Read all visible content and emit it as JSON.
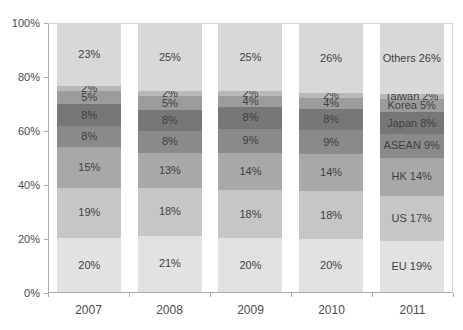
{
  "chart_data": {
    "type": "bar",
    "subtype": "stacked-100",
    "title": "",
    "xlabel": "",
    "ylabel": "",
    "categories": [
      "2007",
      "2008",
      "2009",
      "2010",
      "2011"
    ],
    "y_axis": {
      "min": 0,
      "max": 100,
      "tick_labels": [
        "0%",
        "20%",
        "40%",
        "60%",
        "80%",
        "100%"
      ],
      "tick_step": 20
    },
    "grid": "off",
    "legend": "none (series named in last bar labels)",
    "series": [
      {
        "name": "EU",
        "color": "#e2e2e2",
        "values": [
          20,
          21,
          20,
          20,
          19
        ],
        "labels": [
          "20%",
          "21%",
          "20%",
          "20%",
          "EU 19%"
        ]
      },
      {
        "name": "US",
        "color": "#c6c6c6",
        "values": [
          19,
          18,
          18,
          18,
          17
        ],
        "labels": [
          "19%",
          "18%",
          "18%",
          "18%",
          "US 17%"
        ]
      },
      {
        "name": "HK",
        "color": "#a8a8a8",
        "values": [
          15,
          13,
          14,
          14,
          14
        ],
        "labels": [
          "15%",
          "13%",
          "14%",
          "14%",
          "HK 14%"
        ]
      },
      {
        "name": "ASEAN",
        "color": "#8a8a8a",
        "values": [
          8,
          8,
          9,
          9,
          9
        ],
        "labels": [
          "8%",
          "8%",
          "9%",
          "9%",
          "ASEAN 9%"
        ]
      },
      {
        "name": "Japan",
        "color": "#777777",
        "values": [
          8,
          8,
          8,
          8,
          8
        ],
        "labels": [
          "8%",
          "8%",
          "8%",
          "8%",
          "Japan 8%"
        ]
      },
      {
        "name": "Korea",
        "color": "#9c9c9c",
        "values": [
          5,
          5,
          4,
          4,
          5
        ],
        "labels": [
          "5%",
          "5%",
          "4%",
          "4%",
          "Korea 5%"
        ]
      },
      {
        "name": "Taiwan",
        "color": "#b9b9b9",
        "values": [
          2,
          2,
          2,
          2,
          2
        ],
        "labels": [
          "2%",
          "2%",
          "2%",
          "2%",
          "Taiwan 2%"
        ]
      },
      {
        "name": "Others",
        "color": "#d8d8d8",
        "values": [
          23,
          25,
          25,
          26,
          26
        ],
        "labels": [
          "23%",
          "25%",
          "25%",
          "26%",
          "Others 26%"
        ]
      }
    ],
    "colors": {
      "data_label": "#3f3f3f",
      "axis_label": "#4a4a4a",
      "axis_line": "#a9a9a9",
      "plot_border": "#d6d6d6",
      "background": "#ffffff"
    }
  }
}
